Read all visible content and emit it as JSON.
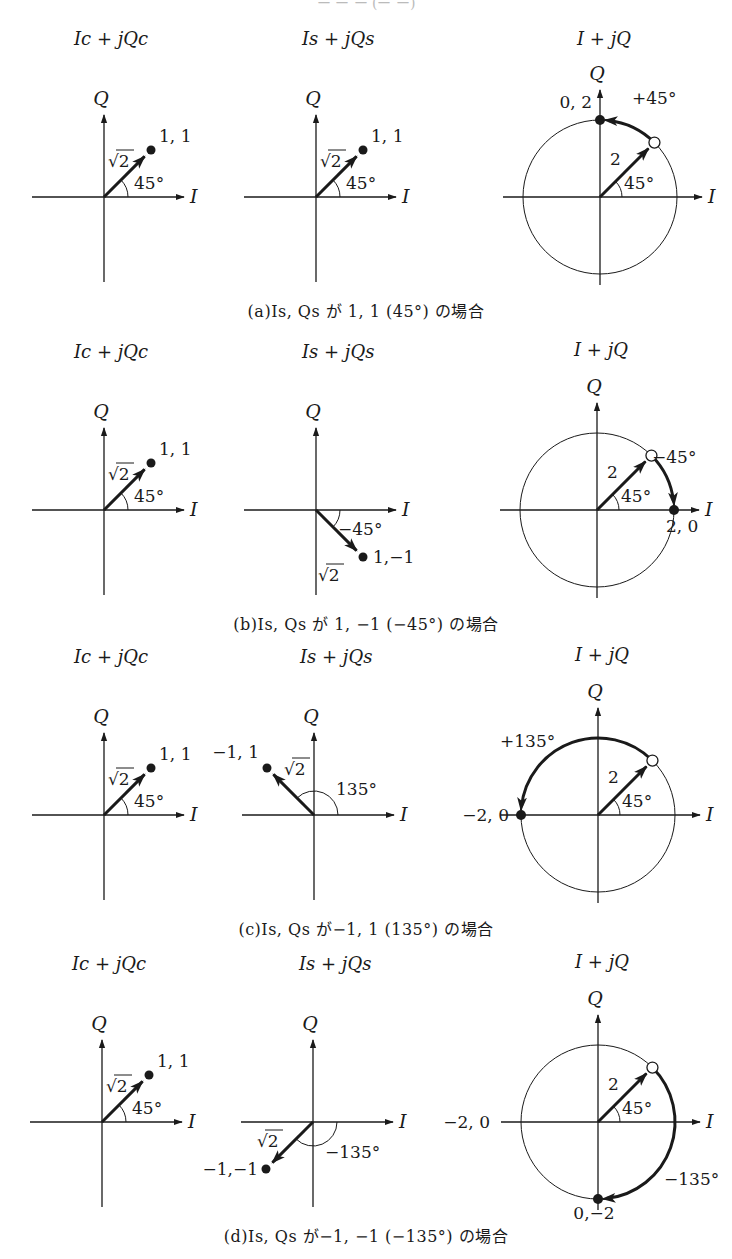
{
  "header_partial": "ー ー ー (ー ー)",
  "panels": [
    {
      "id": "a",
      "caption": "(a)Is, Qs が 1, 1 (45°) の場合",
      "axis_y": 197,
      "titles": {
        "carrier": "Ic + jQc",
        "signal": "Is + jQs",
        "result": "I + jQ"
      },
      "carrier": {
        "origin_x": 104,
        "point_label": "1, 1",
        "length_label": "√2",
        "angle_label": "45°",
        "angle_deg": 45
      },
      "signal": {
        "origin_x": 316,
        "point_label": "1, 1",
        "length_label": "√2",
        "angle_label": "45°",
        "angle_deg": 45
      },
      "result": {
        "center_x": 600,
        "radius": 77,
        "radius_label": "2",
        "start_angle_label": "45°",
        "rotation_label": "+45°",
        "rotation_deg": 45,
        "end_point_label": "0, 2",
        "end_angle_deg": 90
      }
    },
    {
      "id": "b",
      "caption": "(b)Is, Qs が 1, −1 (−45°) の場合",
      "axis_y": 510,
      "titles": {
        "carrier": "Ic + jQc",
        "signal": "Is + jQs",
        "result": "I + jQ"
      },
      "carrier": {
        "origin_x": 104,
        "point_label": "1, 1",
        "length_label": "√2",
        "angle_label": "45°",
        "angle_deg": 45
      },
      "signal": {
        "origin_x": 316,
        "point_label": "1,−1",
        "length_label": "√2",
        "angle_label": "−45°",
        "angle_deg": -45
      },
      "result": {
        "center_x": 597,
        "radius": 77,
        "radius_label": "2",
        "start_angle_label": "45°",
        "rotation_label": "−45°",
        "rotation_deg": -45,
        "end_point_label": "2, 0",
        "end_angle_deg": 0
      }
    },
    {
      "id": "c",
      "caption": "(c)Is, Qs が−1, 1 (135°) の場合",
      "axis_y": 815,
      "titles": {
        "carrier": "Ic + jQc",
        "signal": "Is + jQs",
        "result": "I + jQ"
      },
      "carrier": {
        "origin_x": 104,
        "point_label": "1, 1",
        "length_label": "√2",
        "angle_label": "45°",
        "angle_deg": 45
      },
      "signal": {
        "origin_x": 314,
        "point_label": "−1, 1",
        "length_label": "√2",
        "angle_label": "135°",
        "angle_deg": 135
      },
      "result": {
        "center_x": 598,
        "radius": 77,
        "radius_label": "2",
        "start_angle_label": "45°",
        "rotation_label": "+135°",
        "rotation_deg": 135,
        "end_point_label": "−2, 0",
        "end_angle_deg": 180
      }
    },
    {
      "id": "d",
      "caption": "(d)Is, Qs が−1, −1 (−135°) の場合",
      "axis_y": 1122,
      "titles": {
        "carrier": "Ic + jQc",
        "signal": "Is + jQs",
        "result": "I + jQ"
      },
      "carrier": {
        "origin_x": 102,
        "point_label": "1, 1",
        "length_label": "√2",
        "angle_label": "45°",
        "angle_deg": 45
      },
      "signal": {
        "origin_x": 313,
        "point_label": "−1,−1",
        "length_label": "√2",
        "angle_label": "−135°",
        "angle_deg": -135
      },
      "result": {
        "center_x": 598,
        "radius": 77,
        "radius_label": "2",
        "start_angle_label": "45°",
        "rotation_label": "−135°",
        "rotation_deg": -135,
        "end_point_label": "0,−2",
        "end_angle_deg": -90,
        "left_axis_label": "−2, 0"
      }
    }
  ],
  "axis_labels": {
    "horizontal": "I",
    "vertical": "Q"
  }
}
